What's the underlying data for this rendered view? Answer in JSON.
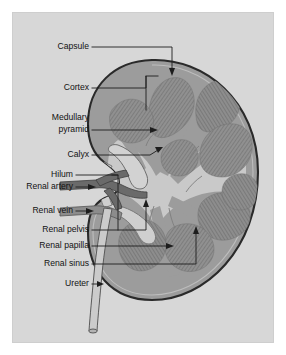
{
  "figure": {
    "view": "coronal section",
    "canvas": {
      "width": 286,
      "height": 355
    },
    "colors": {
      "page_background": "#ffffff",
      "plate_background": "#d7d7d7",
      "cortex_fill": "#9c9c9c",
      "capsule_outline": "#2a2a2a",
      "sinus_fill": "#c9c9c9",
      "pyramid_fill": "#8a8a8a",
      "renal_artery": "#6a6a6a",
      "renal_vein": "#8c8c8c",
      "ureter": "#cbcbcb",
      "label_text": "#121212",
      "leader_line": "#1d1d1d"
    }
  },
  "labels": [
    {
      "id": "capsule",
      "text": "Capsule",
      "text2": "",
      "x": 89,
      "y": 47
    },
    {
      "id": "cortex",
      "text": "Cortex",
      "text2": "",
      "x": 89,
      "y": 88
    },
    {
      "id": "medullary-pyramid",
      "text": "Medullary",
      "text2": "pyramid",
      "x": 89,
      "y": 124
    },
    {
      "id": "calyx",
      "text": "Calyx",
      "text2": "",
      "x": 89,
      "y": 155
    },
    {
      "id": "hilum",
      "text": "Hilum",
      "text2": "",
      "x": 73,
      "y": 175
    },
    {
      "id": "renal-artery",
      "text": "Renal artery",
      "text2": "",
      "x": 73,
      "y": 187
    },
    {
      "id": "renal-vein",
      "text": "Renal vein",
      "text2": "",
      "x": 73,
      "y": 211
    },
    {
      "id": "renal-pelvis",
      "text": "Renal pelvis",
      "text2": "",
      "x": 89,
      "y": 230
    },
    {
      "id": "renal-papilla",
      "text": "Renal papilla",
      "text2": "",
      "x": 89,
      "y": 246
    },
    {
      "id": "renal-sinus",
      "text": "Renal sinus",
      "text2": "",
      "x": 89,
      "y": 264
    },
    {
      "id": "ureter",
      "text": "Ureter",
      "text2": "",
      "x": 89,
      "y": 284
    }
  ],
  "structures": [
    {
      "id": "capsule",
      "name": "Capsule"
    },
    {
      "id": "cortex",
      "name": "Cortex"
    },
    {
      "id": "medullary-pyramid",
      "name": "Medullary pyramid"
    },
    {
      "id": "calyx",
      "name": "Calyx"
    },
    {
      "id": "hilum",
      "name": "Hilum"
    },
    {
      "id": "renal-artery",
      "name": "Renal artery"
    },
    {
      "id": "renal-vein",
      "name": "Renal vein"
    },
    {
      "id": "renal-pelvis",
      "name": "Renal pelvis"
    },
    {
      "id": "renal-papilla",
      "name": "Renal papilla"
    },
    {
      "id": "renal-sinus",
      "name": "Renal sinus"
    },
    {
      "id": "ureter",
      "name": "Ureter"
    }
  ]
}
